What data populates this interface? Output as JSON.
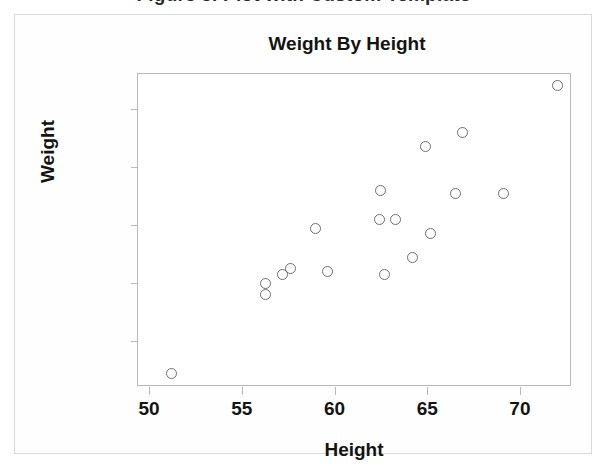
{
  "caption": {
    "text": "Figure 3.  Plot with Custom Template"
  },
  "chart_data": {
    "type": "scatter",
    "title": "Weight By Height",
    "xlabel": "Height",
    "ylabel": "Weight",
    "xlim": [
      49.4,
      72.7
    ],
    "ylim": [
      45.0,
      152.0
    ],
    "xticks": [
      50,
      55,
      60,
      65,
      70
    ],
    "yticks": [
      60,
      80,
      100,
      120,
      140
    ],
    "grid": false,
    "legend": null,
    "marker": {
      "shape": "open-circle",
      "edge_color": "#6d6d73",
      "fill": "none",
      "size_px": 11
    },
    "series": [
      {
        "name": "observations",
        "points": [
          {
            "x": 51.2,
            "y": 49
          },
          {
            "x": 56.3,
            "y": 80
          },
          {
            "x": 56.3,
            "y": 76
          },
          {
            "x": 57.2,
            "y": 83
          },
          {
            "x": 57.6,
            "y": 85
          },
          {
            "x": 59.0,
            "y": 99
          },
          {
            "x": 59.6,
            "y": 84
          },
          {
            "x": 62.4,
            "y": 102
          },
          {
            "x": 62.5,
            "y": 112
          },
          {
            "x": 62.7,
            "y": 83
          },
          {
            "x": 63.3,
            "y": 102
          },
          {
            "x": 64.2,
            "y": 89
          },
          {
            "x": 64.9,
            "y": 127
          },
          {
            "x": 65.2,
            "y": 97
          },
          {
            "x": 66.5,
            "y": 111
          },
          {
            "x": 66.9,
            "y": 132
          },
          {
            "x": 69.1,
            "y": 111
          },
          {
            "x": 72.0,
            "y": 148
          }
        ]
      }
    ]
  }
}
